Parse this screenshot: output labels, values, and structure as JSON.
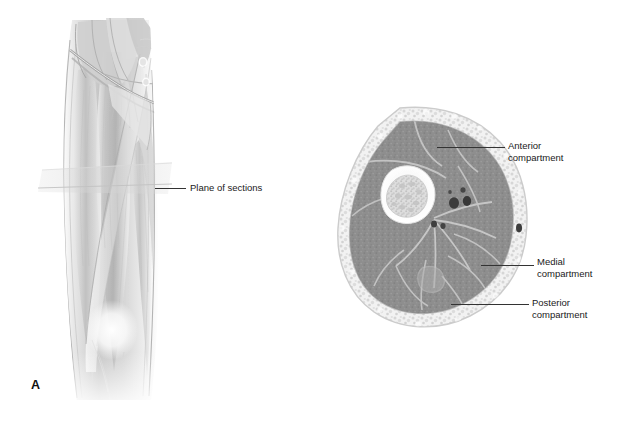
{
  "figure": {
    "background_color": "#ffffff",
    "width": 631,
    "height": 425,
    "line_color": "#333333",
    "text_color": "#1a1a1a"
  },
  "panels": {
    "a": {
      "letter": "A",
      "view": "anterior view of right thigh",
      "callout": {
        "label": "Plane of sections"
      }
    },
    "b": {
      "letter": "B",
      "view": "transverse section of mid-thigh",
      "callouts": [
        {
          "label": "Anterior\ncompartment"
        },
        {
          "label": "Medial\ncompartment"
        },
        {
          "label": "Posterior\ncompartment"
        }
      ]
    }
  },
  "anatomy_colors": {
    "skin_outline": "#c9c9c9",
    "subcutaneous_fat": "#efefef",
    "muscle": "#8d8d8d",
    "fascia": "#bdbdbd",
    "bone_cortex": "#fafafa",
    "bone_marrow": "#d8d8d8",
    "vessel": "#3a3a3a",
    "illustration_ink": "#9a9a9a"
  }
}
